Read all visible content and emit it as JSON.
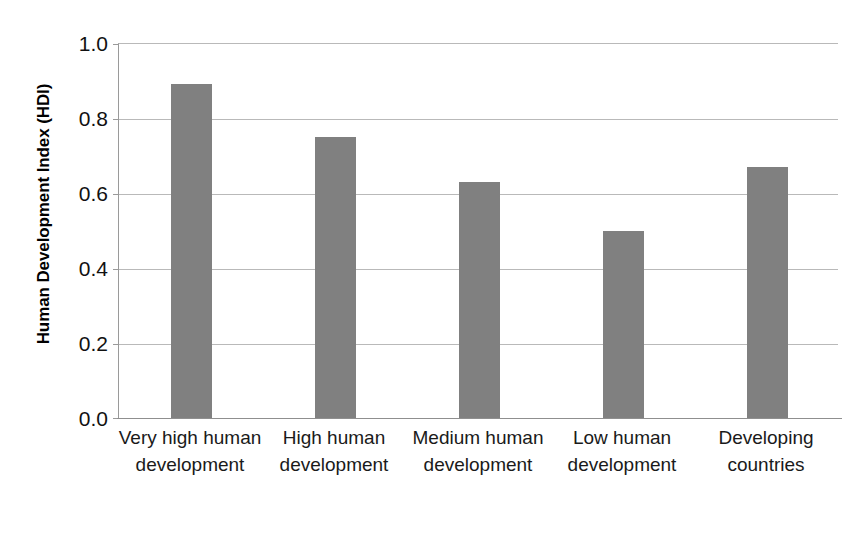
{
  "chart_data": {
    "type": "bar",
    "title": "",
    "subtitle": "",
    "xlabel": "",
    "ylabel": "Human Development Index (HDI)",
    "categories": [
      "Very high human development",
      "High human development",
      "Medium human development",
      "Low human development",
      "Developing countries"
    ],
    "values": [
      0.89,
      0.75,
      0.63,
      0.5,
      0.67
    ],
    "ylim": [
      0.0,
      1.0
    ],
    "yticks": [
      0.0,
      0.2,
      0.4,
      0.6,
      0.8,
      1.0
    ],
    "ytick_labels": [
      "0.0",
      "0.2",
      "0.4",
      "0.6",
      "0.8",
      "1.0"
    ],
    "grid": "horizontal",
    "legend": "none",
    "bar_color": "#808080",
    "gridline_color": "#b9b9b9",
    "axis_color": "#8f8f8f",
    "background": "#ffffff"
  },
  "axis": {
    "y_title": "Human Development Index (HDI)",
    "tick_0": "0.0",
    "tick_1": "0.2",
    "tick_2": "0.4",
    "tick_3": "0.6",
    "tick_4": "0.8",
    "tick_5": "1.0"
  },
  "categories": {
    "cat_0": "Very high human development",
    "cat_1": "High human development",
    "cat_2": "Medium human development",
    "cat_3": "Low human development",
    "cat_4": "Developing countries"
  }
}
